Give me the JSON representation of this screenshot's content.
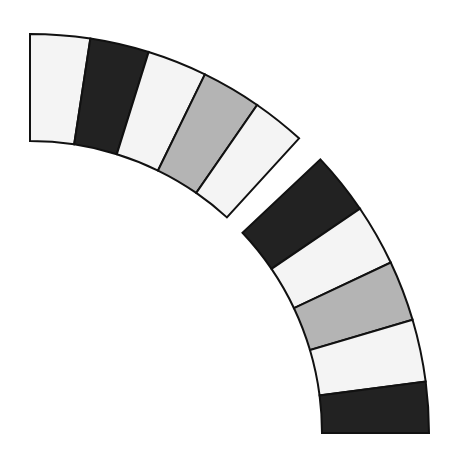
{
  "diagram": {
    "center": [
      30,
      433
    ],
    "outer_radius": 399,
    "inner_radius": 292,
    "stroke_color": "#111111",
    "colors": {
      "white": "#f4f4f4",
      "black": "#222222",
      "gray": "#b4b4b4"
    },
    "sections": [
      {
        "name": "upper-section",
        "segments": [
          {
            "from": 90.0,
            "to": 81.3,
            "color": "white"
          },
          {
            "from": 81.3,
            "to": 72.7,
            "color": "black"
          },
          {
            "from": 72.7,
            "to": 64.0,
            "color": "white"
          },
          {
            "from": 64.0,
            "to": 55.3,
            "color": "gray"
          },
          {
            "from": 55.3,
            "to": 47.6,
            "color": "white"
          }
        ]
      },
      {
        "name": "lower-section",
        "segments": [
          {
            "from": 43.3,
            "to": 34.2,
            "color": "black"
          },
          {
            "from": 34.2,
            "to": 25.3,
            "color": "white"
          },
          {
            "from": 25.3,
            "to": 16.5,
            "color": "gray"
          },
          {
            "from": 16.5,
            "to": 7.4,
            "color": "white"
          },
          {
            "from": 7.4,
            "to": 0.0,
            "color": "black"
          }
        ]
      }
    ]
  }
}
